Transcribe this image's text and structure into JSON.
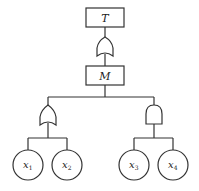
{
  "diagram": {
    "type": "fault-tree",
    "top_event": {
      "label": "T"
    },
    "intermediate_event": {
      "label": "M"
    },
    "gates": [
      {
        "name": "top-gate",
        "kind": "OR"
      },
      {
        "name": "left-gate",
        "kind": "OR"
      },
      {
        "name": "right-gate",
        "kind": "AND"
      }
    ],
    "basic_events": [
      {
        "label": "x",
        "sub": "1"
      },
      {
        "label": "x",
        "sub": "2"
      },
      {
        "label": "x",
        "sub": "3"
      },
      {
        "label": "x",
        "sub": "4"
      }
    ],
    "colors": {
      "stroke": "#333333",
      "background": "#ffffff"
    }
  }
}
